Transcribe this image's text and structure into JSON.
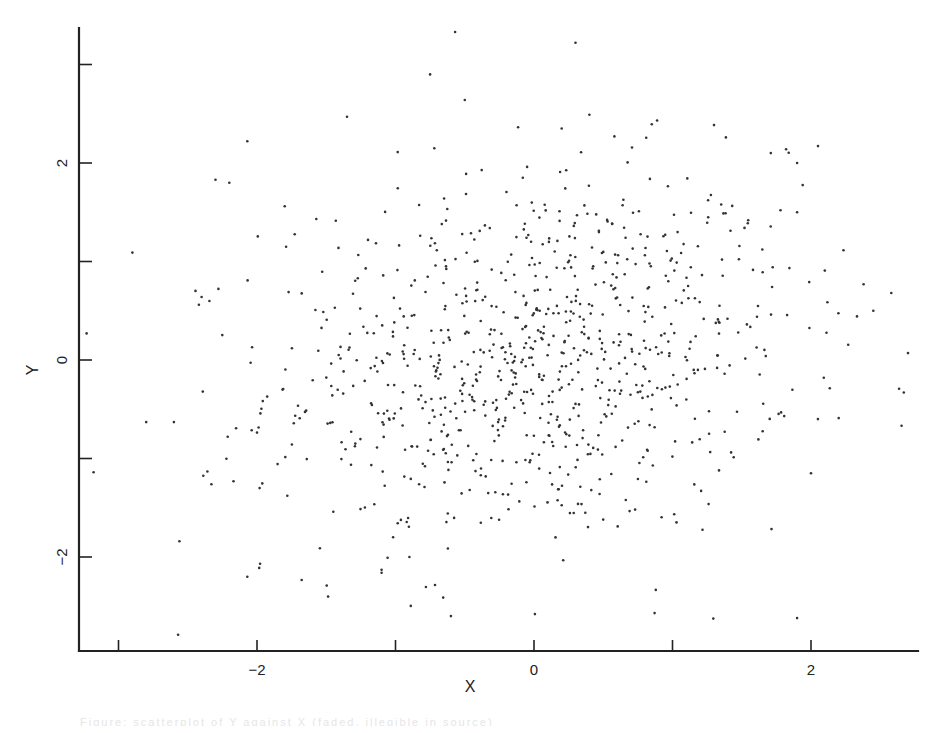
{
  "chart_data": {
    "type": "scatter",
    "title": "",
    "xlabel": "X",
    "ylabel": "Y",
    "xlim": [
      -3.28,
      2.78
    ],
    "ylim": [
      -2.94,
      3.42
    ],
    "x_ticks": [
      -3,
      -2,
      -1,
      0,
      1,
      2
    ],
    "x_tick_labels": [
      "",
      "-2",
      "",
      "0",
      "",
      "2"
    ],
    "y_ticks": [
      -2,
      -1,
      0,
      1,
      2,
      3
    ],
    "y_tick_labels": [
      "-2",
      "",
      "0",
      "",
      "2",
      ""
    ],
    "grid": false,
    "legend": null,
    "marker": {
      "shape": "dot",
      "size": 2.2,
      "color": "#333333"
    },
    "approx_point_count": 1000,
    "distribution": {
      "description": "Bivariate normal cloud, weak positive correlation, centered near origin",
      "mean_x": 0.0,
      "mean_y": 0.0,
      "sd_x": 0.95,
      "sd_y": 0.95,
      "correlation": 0.15,
      "generated_points": 900,
      "seed": 12345
    },
    "sampled_points": [
      [
        -0.57,
        3.33
      ],
      [
        0.3,
        3.22
      ],
      [
        -0.75,
        2.9
      ],
      [
        -0.5,
        2.64
      ],
      [
        -1.35,
        2.47
      ],
      [
        -3.23,
        0.27
      ],
      [
        -2.9,
        1.09
      ],
      [
        -2.4,
        0.64
      ],
      [
        -2.07,
        2.22
      ],
      [
        -2.3,
        1.83
      ],
      [
        -2.2,
        1.8
      ],
      [
        -1.8,
        1.56
      ],
      [
        -2.8,
        -0.63
      ],
      [
        -2.6,
        -0.63
      ],
      [
        -2.56,
        -1.84
      ],
      [
        -2.57,
        -2.79
      ],
      [
        -2.07,
        -2.2
      ],
      [
        -3.18,
        -1.14
      ],
      [
        -1.1,
        -2.16
      ],
      [
        -1.1,
        -2.13
      ],
      [
        -0.9,
        -2.0
      ],
      [
        -0.6,
        -2.6
      ],
      [
        -0.3,
        -2.93
      ],
      [
        1.9,
        -2.62
      ],
      [
        2.7,
        0.07
      ],
      [
        2.67,
        -0.33
      ],
      [
        2.58,
        0.68
      ],
      [
        2.38,
        0.77
      ],
      [
        2.45,
        0.5
      ],
      [
        2.0,
        -1.15
      ],
      [
        2.05,
        -0.6
      ],
      [
        2.2,
        -0.59
      ],
      [
        1.71,
        2.1
      ],
      [
        1.82,
        2.14
      ],
      [
        1.9,
        2.0
      ],
      [
        1.78,
        1.52
      ],
      [
        1.9,
        1.5
      ],
      [
        0.2,
        2.35
      ],
      [
        0.4,
        2.49
      ],
      [
        -0.05,
        1.96
      ],
      [
        0.34,
        2.11
      ],
      [
        -0.72,
        2.15
      ]
    ]
  },
  "caption": {
    "text": "Figure: scatterplot of Y against X (faded, illegible in source)"
  }
}
